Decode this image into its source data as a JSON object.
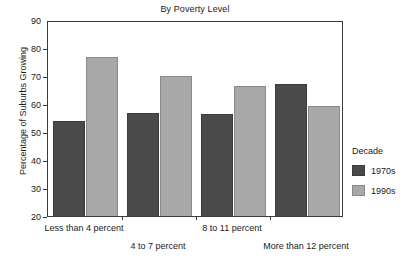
{
  "chart_data": {
    "type": "bar",
    "title": "By Poverty Level",
    "xlabel": "",
    "ylabel": "Percentage of Suburbs Growing",
    "categories": [
      "Less than 4 percent",
      "4 to 7 percent",
      "8 to 11 percent",
      "More than 12 percent"
    ],
    "series": [
      {
        "name": "1970s",
        "color": "#4a4a4a",
        "values": [
          53.8,
          56.9,
          56.6,
          67.2
        ]
      },
      {
        "name": "1990s",
        "color": "#a8a8a8",
        "values": [
          76.7,
          70.0,
          66.5,
          59.4
        ]
      }
    ],
    "ylim": [
      20,
      90
    ],
    "yticks": [
      20,
      30,
      40,
      50,
      60,
      70,
      80,
      90
    ],
    "ytick_labels": [
      "20",
      "30",
      "40",
      "50",
      "60",
      "70",
      "80",
      "90"
    ],
    "grid": false,
    "legend": {
      "title": "Decade",
      "position": "right",
      "entries": [
        "1970s",
        "1990s"
      ]
    }
  },
  "legend": {
    "title": "Decade",
    "entries": [
      {
        "label": "1970s",
        "color": "#4a4a4a"
      },
      {
        "label": "1990s",
        "color": "#a8a8a8"
      }
    ]
  }
}
